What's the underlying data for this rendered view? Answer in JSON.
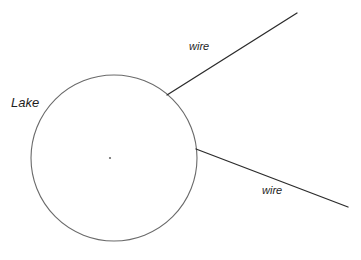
{
  "canvas": {
    "width": 361,
    "height": 260,
    "background_color": "#ffffff"
  },
  "diagram": {
    "title_text": "Lake and wires diagram",
    "lake": {
      "label": "Lake",
      "shape": "circle",
      "center_x": 114,
      "center_y": 158,
      "radius": 83,
      "stroke_color": "#6a6a6a",
      "stroke_width": 1.1,
      "fill": "none"
    },
    "center_point": {
      "label": "center-point",
      "x": 110,
      "y": 158,
      "radius": 1.1,
      "color": "#6a6a6a"
    },
    "wires": [
      {
        "label": "wire",
        "name": "upper-wire",
        "x1": 167,
        "y1": 95,
        "x2": 297,
        "y2": 13,
        "stroke_color": "#2b2b2b",
        "stroke_width": 1.3,
        "label_x": 189,
        "label_y": 41
      },
      {
        "label": "wire",
        "name": "lower-wire",
        "x1": 196,
        "y1": 149,
        "x2": 348,
        "y2": 207,
        "stroke_color": "#2b2b2b",
        "stroke_width": 1.3,
        "label_x": 262,
        "label_y": 185
      }
    ],
    "labels": {
      "lake": "Lake",
      "wire_upper": "wire",
      "wire_lower": "wire"
    }
  }
}
